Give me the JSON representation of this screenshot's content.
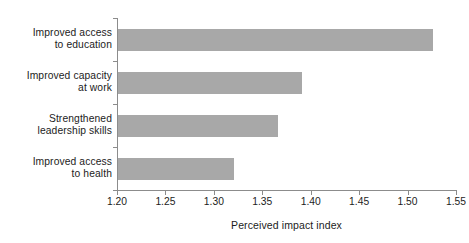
{
  "chart_data": {
    "type": "bar",
    "orientation": "horizontal",
    "title": "",
    "subtitle": "",
    "xlabel": "Perceived impact index",
    "ylabel": "",
    "categories": [
      "Improved access\nto education",
      "Improved capacity\nat work",
      "Strengthened\nleadership skills",
      "Improved access\nto health"
    ],
    "values": [
      1.525,
      1.39,
      1.365,
      1.32
    ],
    "xlim": [
      1.2,
      1.55
    ],
    "xticks": [
      1.2,
      1.25,
      1.3,
      1.35,
      1.4,
      1.45,
      1.5,
      1.55
    ],
    "xtick_labels": [
      "1.20",
      "1.25",
      "1.30",
      "1.35",
      "1.40",
      "1.45",
      "1.50",
      "1.55"
    ],
    "grid": false,
    "legend": false,
    "bar_color": "#a8a8a8",
    "axis_color": "#8c8c8c",
    "background_color": "#ffffff",
    "text_color": "#1c1c1c"
  }
}
